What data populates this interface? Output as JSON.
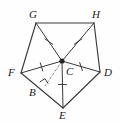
{
  "figure": {
    "background_color": "#fefefe",
    "stroke_color": "#3a3a3a",
    "label_color": "#1a1a1a",
    "labels": {
      "G": "G",
      "H": "H",
      "F": "F",
      "D": "D",
      "C": "C",
      "B": "B",
      "E": "E"
    },
    "points": {
      "G": {
        "x": 36,
        "y": 23
      },
      "H": {
        "x": 94,
        "y": 23
      },
      "F": {
        "x": 21,
        "y": 73
      },
      "D": {
        "x": 100,
        "y": 72
      },
      "E": {
        "x": 63,
        "y": 108
      },
      "C": {
        "x": 62,
        "y": 61
      },
      "B": {
        "x": 45,
        "y": 86
      }
    },
    "label_positions": {
      "G": {
        "x": 29,
        "y": 9
      },
      "H": {
        "x": 92,
        "y": 9
      },
      "F": {
        "x": 8,
        "y": 67
      },
      "D": {
        "x": 104,
        "y": 67
      },
      "C": {
        "x": 66,
        "y": 66
      },
      "B": {
        "x": 29,
        "y": 87
      },
      "E": {
        "x": 59,
        "y": 110
      }
    },
    "sides": [
      {
        "from": "G",
        "to": "H",
        "name": "side-gh"
      },
      {
        "from": "H",
        "to": "D",
        "name": "side-hd"
      },
      {
        "from": "D",
        "to": "E",
        "name": "side-de"
      },
      {
        "from": "E",
        "to": "F",
        "name": "side-ef"
      },
      {
        "from": "F",
        "to": "G",
        "name": "side-fg"
      }
    ],
    "radii": [
      {
        "from": "C",
        "to": "G",
        "name": "radius-cg",
        "tick": true
      },
      {
        "from": "C",
        "to": "H",
        "name": "radius-ch",
        "tick": true
      },
      {
        "from": "C",
        "to": "D",
        "name": "radius-cd",
        "tick": true
      },
      {
        "from": "C",
        "to": "E",
        "name": "radius-ce",
        "tick": true
      },
      {
        "from": "C",
        "to": "F",
        "name": "radius-cf",
        "tick": true
      }
    ],
    "apothem": {
      "from": "C",
      "to": "B",
      "name": "apothem-cb",
      "style": "dashed",
      "right_angle": true
    },
    "center_dot": {
      "x": 62,
      "y": 61,
      "r": 2.6
    },
    "tick_marks_count": 5,
    "right_angle_marker": "square at B on segment FE"
  }
}
